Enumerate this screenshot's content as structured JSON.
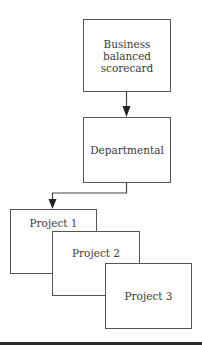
{
  "diagram": {
    "type": "hierarchy-flow",
    "nodes": [
      {
        "id": "bsc",
        "label_lines": [
          "Business balanced",
          "scorecard"
        ]
      },
      {
        "id": "dept",
        "label_lines": [
          "Departmental"
        ]
      },
      {
        "id": "p1",
        "label_lines": [
          "Project 1"
        ]
      },
      {
        "id": "p2",
        "label_lines": [
          "Project 2"
        ]
      },
      {
        "id": "p3",
        "label_lines": [
          "Project 3"
        ]
      }
    ],
    "edges": [
      {
        "from": "bsc",
        "to": "dept"
      },
      {
        "from": "dept",
        "to": "p1"
      }
    ],
    "note": "Project 1, 2, 3 are shown as overlapping stacked boxes"
  },
  "colors": {
    "stroke": "#555555",
    "text": "#3a3a3a",
    "background": "#ffffff",
    "footer_bar": "#2a2a2a"
  }
}
